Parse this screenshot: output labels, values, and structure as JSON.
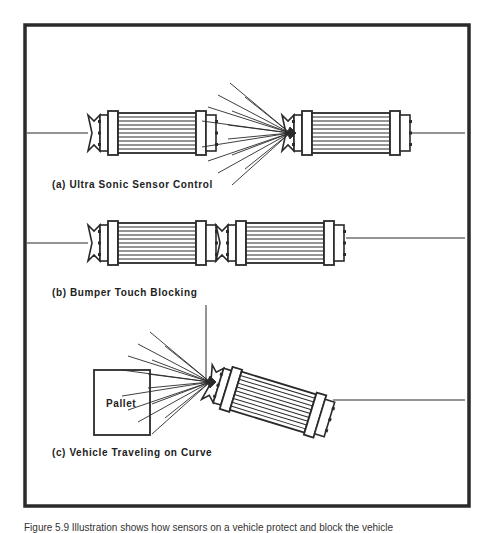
{
  "figure": {
    "panels": [
      {
        "id": "a",
        "label": "(a) Ultra Sonic Sensor Control"
      },
      {
        "id": "b",
        "label": "(b) Bumper Touch Blocking"
      },
      {
        "id": "c",
        "label": "(c) Vehicle Traveling on Curve"
      }
    ],
    "pallet_label": "Pallet",
    "caption": "Figure 5.9 Illustration shows how sensors on a vehicle protect and block the vehicle"
  },
  "colors": {
    "frame": "#2a2a2a",
    "line": "#2a2a2a",
    "background": "#ffffff"
  }
}
